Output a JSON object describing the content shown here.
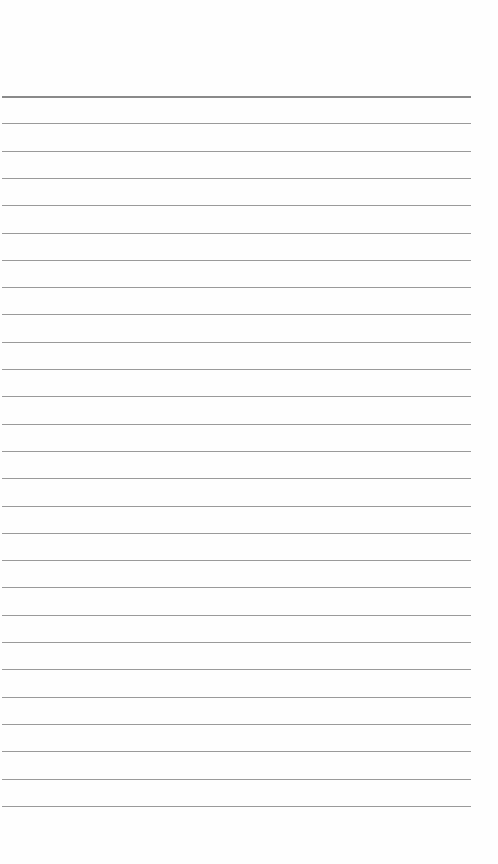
{
  "page": {
    "type": "lined-paper",
    "background": "#fefefe",
    "rule_color": "#9a9a9a",
    "first_rule_y": 96,
    "rule_spacing": 27.3,
    "rule_count": 27,
    "rule_left": 2,
    "rule_width": 469
  }
}
